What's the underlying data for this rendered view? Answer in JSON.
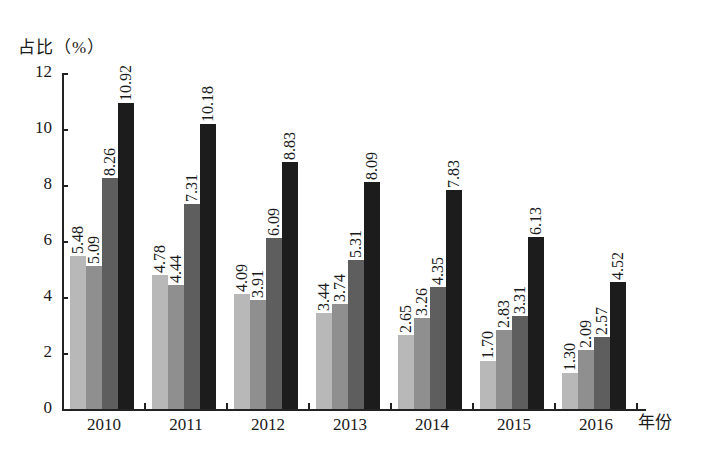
{
  "chart_data": {
    "type": "bar",
    "title": "",
    "ylabel": "占比（%）",
    "xlabel": "年份",
    "ylim": [
      0,
      12
    ],
    "yticks": [
      0,
      2,
      4,
      6,
      8,
      10,
      12
    ],
    "grid": false,
    "legend": null,
    "categories": [
      "2010",
      "2011",
      "2012",
      "2013",
      "2014",
      "2015",
      "2016"
    ],
    "series": [
      {
        "name": "series-1",
        "color": "#b8b8b8",
        "values": [
          5.48,
          4.78,
          4.09,
          3.44,
          2.65,
          1.7,
          1.3
        ]
      },
      {
        "name": "series-2",
        "color": "#8f8f8f",
        "values": [
          5.09,
          4.44,
          3.91,
          3.74,
          3.26,
          2.83,
          2.09
        ]
      },
      {
        "name": "series-3",
        "color": "#5e5e5e",
        "values": [
          8.26,
          7.31,
          6.09,
          5.31,
          4.35,
          3.31,
          2.57
        ]
      },
      {
        "name": "series-4",
        "color": "#1c1c1c",
        "values": [
          10.92,
          10.18,
          8.83,
          8.09,
          7.83,
          6.13,
          4.52
        ]
      }
    ],
    "value_labels": [
      [
        "5.48",
        "4.78",
        "4.09",
        "3.44",
        "2.65",
        "1.70",
        "1.30"
      ],
      [
        "5.09",
        "4.44",
        "3.91",
        "3.74",
        "3.26",
        "2.83",
        "2.09"
      ],
      [
        "8.26",
        "7.31",
        "6.09",
        "5.31",
        "4.35",
        "3.31",
        "2.57"
      ],
      [
        "10.92",
        "10.18",
        "8.83",
        "8.09",
        "7.83",
        "6.13",
        "4.52"
      ]
    ]
  },
  "axis": {
    "y_title": "占比（%）",
    "x_title": "年份",
    "y_tick_labels": [
      "0",
      "2",
      "4",
      "6",
      "8",
      "10",
      "12"
    ],
    "x_tick_labels": [
      "2010",
      "2011",
      "2012",
      "2013",
      "2014",
      "2015",
      "2016"
    ]
  }
}
